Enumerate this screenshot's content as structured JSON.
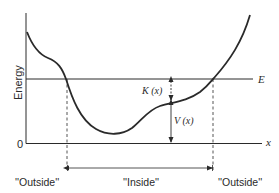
{
  "diagram": {
    "y_axis_label": "Energy",
    "x_axis_label": "x",
    "origin_label": "0",
    "energy_line_label": "E",
    "kinetic_label": "K (x)",
    "potential_label": "V (x)",
    "regions": [
      {
        "label": "''Outside''"
      },
      {
        "label": "''Inside''"
      },
      {
        "label": "''Outside''"
      }
    ],
    "colors": {
      "stroke": "#2a2a2a",
      "background": "#ffffff"
    }
  }
}
